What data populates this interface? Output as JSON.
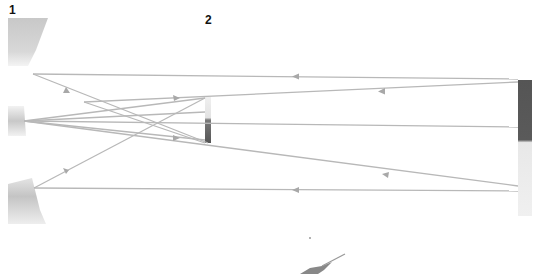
{
  "labels": {
    "mirror_1": "1",
    "mirror_2": "2"
  },
  "colors": {
    "ray": "#b8b8b8",
    "arrow": "#a8a8a8",
    "mirror_light": "#d6d6d6",
    "mirror_dark": "#5a5a5a",
    "label": "#111111"
  },
  "elements": {
    "left_top_mirror": "mirror-segment",
    "left_middle_mirror": "mirror-segment",
    "left_bottom_mirror": "mirror-segment",
    "center_mirror_2": "small-mirror",
    "right_mirror": "large-mirror",
    "bottom_fragment": "partial-object"
  }
}
